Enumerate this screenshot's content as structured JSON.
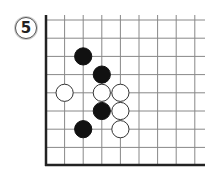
{
  "problem": {
    "number": "5"
  },
  "board": {
    "origin_x": 46,
    "origin_y": 20,
    "spacing_x": 18.6,
    "spacing_y": 18.2,
    "cols": 9,
    "rows": 8,
    "line_color": "#888888",
    "edge_color": "#222222",
    "edges": [
      "left",
      "bottom"
    ],
    "stones": [
      {
        "color": "black",
        "col": 2,
        "row": 2
      },
      {
        "color": "black",
        "col": 3,
        "row": 3
      },
      {
        "color": "white",
        "col": 1,
        "row": 4
      },
      {
        "color": "white",
        "col": 3,
        "row": 4
      },
      {
        "color": "white",
        "col": 4,
        "row": 4
      },
      {
        "color": "black",
        "col": 3,
        "row": 5
      },
      {
        "color": "white",
        "col": 4,
        "row": 5
      },
      {
        "color": "black",
        "col": 2,
        "row": 6
      },
      {
        "color": "white",
        "col": 4,
        "row": 6
      }
    ]
  }
}
